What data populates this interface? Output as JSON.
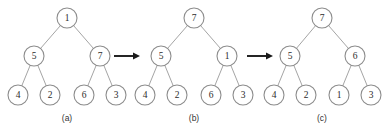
{
  "figure": {
    "background_color": "#ffffff",
    "node_stroke_color": "#8c8c8c",
    "edge_stroke_color": "#9a9a9a",
    "arrow_color": "#1a1a1a",
    "label_color": "#2b2b2b"
  },
  "panels": [
    {
      "caption": "(a)",
      "caption_x": 67,
      "caption_y": 118,
      "nodes": [
        {
          "id": "a-root",
          "value": "1",
          "x": 67,
          "y": 18,
          "r": 10
        },
        {
          "id": "a-l",
          "value": "5",
          "x": 34,
          "y": 56,
          "r": 10
        },
        {
          "id": "a-r",
          "value": "7",
          "x": 100,
          "y": 56,
          "r": 10
        },
        {
          "id": "a-ll",
          "value": "4",
          "x": 18,
          "y": 95,
          "r": 10
        },
        {
          "id": "a-lr",
          "value": "2",
          "x": 50,
          "y": 95,
          "r": 10
        },
        {
          "id": "a-rl",
          "value": "6",
          "x": 84,
          "y": 95,
          "r": 10
        },
        {
          "id": "a-rr",
          "value": "3",
          "x": 116,
          "y": 95,
          "r": 10
        }
      ],
      "edges": [
        {
          "from": "a-root",
          "to": "a-l"
        },
        {
          "from": "a-root",
          "to": "a-r"
        },
        {
          "from": "a-l",
          "to": "a-ll"
        },
        {
          "from": "a-l",
          "to": "a-lr"
        },
        {
          "from": "a-r",
          "to": "a-rl"
        },
        {
          "from": "a-r",
          "to": "a-rr"
        }
      ]
    },
    {
      "caption": "(b)",
      "caption_x": 194,
      "caption_y": 118,
      "nodes": [
        {
          "id": "b-root",
          "value": "7",
          "x": 194,
          "y": 18,
          "r": 10
        },
        {
          "id": "b-l",
          "value": "5",
          "x": 161,
          "y": 56,
          "r": 10
        },
        {
          "id": "b-r",
          "value": "1",
          "x": 227,
          "y": 56,
          "r": 10
        },
        {
          "id": "b-ll",
          "value": "4",
          "x": 145,
          "y": 95,
          "r": 10
        },
        {
          "id": "b-lr",
          "value": "2",
          "x": 177,
          "y": 95,
          "r": 10
        },
        {
          "id": "b-rl",
          "value": "6",
          "x": 211,
          "y": 95,
          "r": 10
        },
        {
          "id": "b-rr",
          "value": "3",
          "x": 243,
          "y": 95,
          "r": 10
        }
      ],
      "edges": [
        {
          "from": "b-root",
          "to": "b-l"
        },
        {
          "from": "b-root",
          "to": "b-r"
        },
        {
          "from": "b-l",
          "to": "b-ll"
        },
        {
          "from": "b-l",
          "to": "b-lr"
        },
        {
          "from": "b-r",
          "to": "b-rl"
        },
        {
          "from": "b-r",
          "to": "b-rr"
        }
      ]
    },
    {
      "caption": "(c)",
      "caption_x": 322,
      "caption_y": 118,
      "nodes": [
        {
          "id": "c-root",
          "value": "7",
          "x": 322,
          "y": 18,
          "r": 10
        },
        {
          "id": "c-l",
          "value": "5",
          "x": 290,
          "y": 56,
          "r": 10
        },
        {
          "id": "c-r",
          "value": "6",
          "x": 355,
          "y": 56,
          "r": 10
        },
        {
          "id": "c-ll",
          "value": "4",
          "x": 274,
          "y": 95,
          "r": 10
        },
        {
          "id": "c-lr",
          "value": "2",
          "x": 306,
          "y": 95,
          "r": 10
        },
        {
          "id": "c-rl",
          "value": "1",
          "x": 339,
          "y": 95,
          "r": 10
        },
        {
          "id": "c-rr",
          "value": "3",
          "x": 371,
          "y": 95,
          "r": 10
        }
      ],
      "edges": [
        {
          "from": "c-root",
          "to": "c-l"
        },
        {
          "from": "c-root",
          "to": "c-r"
        },
        {
          "from": "c-l",
          "to": "c-ll"
        },
        {
          "from": "c-l",
          "to": "c-lr"
        },
        {
          "from": "c-r",
          "to": "c-rl"
        },
        {
          "from": "c-r",
          "to": "c-rr"
        }
      ]
    }
  ],
  "arrows": [
    {
      "id": "arrow-a-to-b",
      "x1": 114,
      "x2": 140,
      "y": 56
    },
    {
      "id": "arrow-b-to-c",
      "x1": 247,
      "x2": 273,
      "y": 56
    }
  ]
}
